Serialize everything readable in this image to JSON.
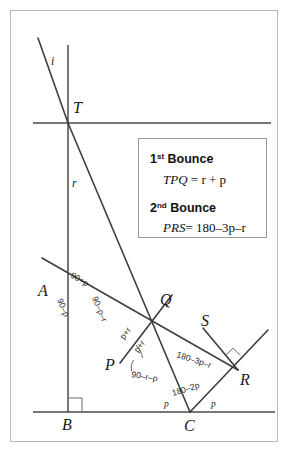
{
  "figure": {
    "type": "geometry-diagram"
  },
  "points": {
    "T": {
      "label": "T",
      "x": 68,
      "y": 123
    },
    "A": {
      "label": "A",
      "x": 45,
      "y": 290
    },
    "P": {
      "label": "P",
      "x": 120,
      "y": 363
    },
    "Q": {
      "label": "Q",
      "x": 166,
      "y": 302
    },
    "S": {
      "label": "S",
      "x": 207,
      "y": 323
    },
    "R": {
      "label": "R",
      "x": 238,
      "y": 370
    },
    "B": {
      "label": "B",
      "x": 68,
      "y": 412
    },
    "C": {
      "label": "C",
      "x": 190,
      "y": 412
    }
  },
  "ray_labels": {
    "incident": "i",
    "reflected": "r"
  },
  "angle_labels": {
    "at_A_above": "90+p",
    "at_A_below": "90–p",
    "along_AP": "90–p–r",
    "at_P_upper": "p+r",
    "at_P_inner": "p+r",
    "at_P_lower": "90–r–p",
    "along_PR": "180–3p–r",
    "at_C_apex": "180–2p",
    "at_C_left": "p",
    "at_C_right": "p"
  },
  "info_box": {
    "bounce1": {
      "ordinal": "1",
      "ordinal_suffix": "st",
      "heading_word": "Bounce",
      "equation_name": "TPQ",
      "equation_rest": "= r + p"
    },
    "bounce2": {
      "ordinal": "2",
      "ordinal_suffix": "nd",
      "heading_word": "Bounce",
      "equation_name": "PRS",
      "equation_rest": "= 180–3p–r"
    }
  },
  "colors": {
    "ray": "#3d3d3d",
    "mirror": "#4a4a4a",
    "frame": "#b8b8b8",
    "text": "#1a1a1a",
    "box_border": "#9a9a9a"
  }
}
